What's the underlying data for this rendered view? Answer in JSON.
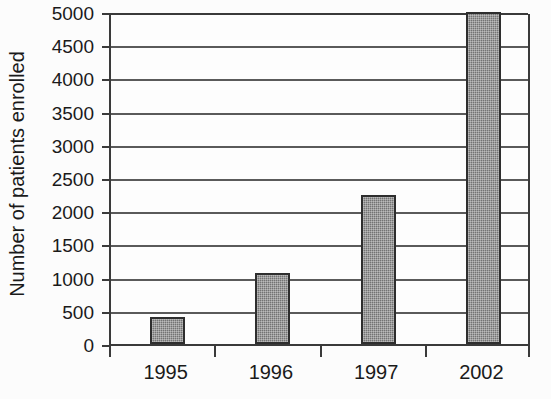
{
  "chart_data": {
    "type": "bar",
    "title": "",
    "subtitle": "",
    "xlabel": "",
    "ylabel": "Number of patients enrolled",
    "categories": [
      "1995",
      "1996",
      "1997",
      "2002"
    ],
    "values": [
      400,
      1070,
      2250,
      5000
    ],
    "series": [
      {
        "name": "Number of patients enrolled",
        "values": [
          400,
          1070,
          2250,
          5000
        ]
      }
    ],
    "ylim": [
      0,
      5000
    ],
    "ytick_labels": [
      "0",
      "500",
      "1000",
      "1500",
      "2000",
      "2500",
      "3000",
      "3500",
      "4000",
      "4500",
      "5000"
    ],
    "ytick_values": [
      0,
      500,
      1000,
      1500,
      2000,
      2500,
      3000,
      3500,
      4000,
      4500,
      5000
    ],
    "ytick_step": 500,
    "xtick_labels": [
      "1995",
      "1996",
      "1997",
      "2002"
    ],
    "grid": "horizontal",
    "legend": "none",
    "annotations": [],
    "bar_fill_color": "#7a7a7a",
    "bar_border_color": "#2e2e2e",
    "axis_color": "#3a3a3a",
    "gridline_color": "#5a5a5a",
    "background_color": "#fcfcfc",
    "text_color": "#1a1a1a"
  }
}
